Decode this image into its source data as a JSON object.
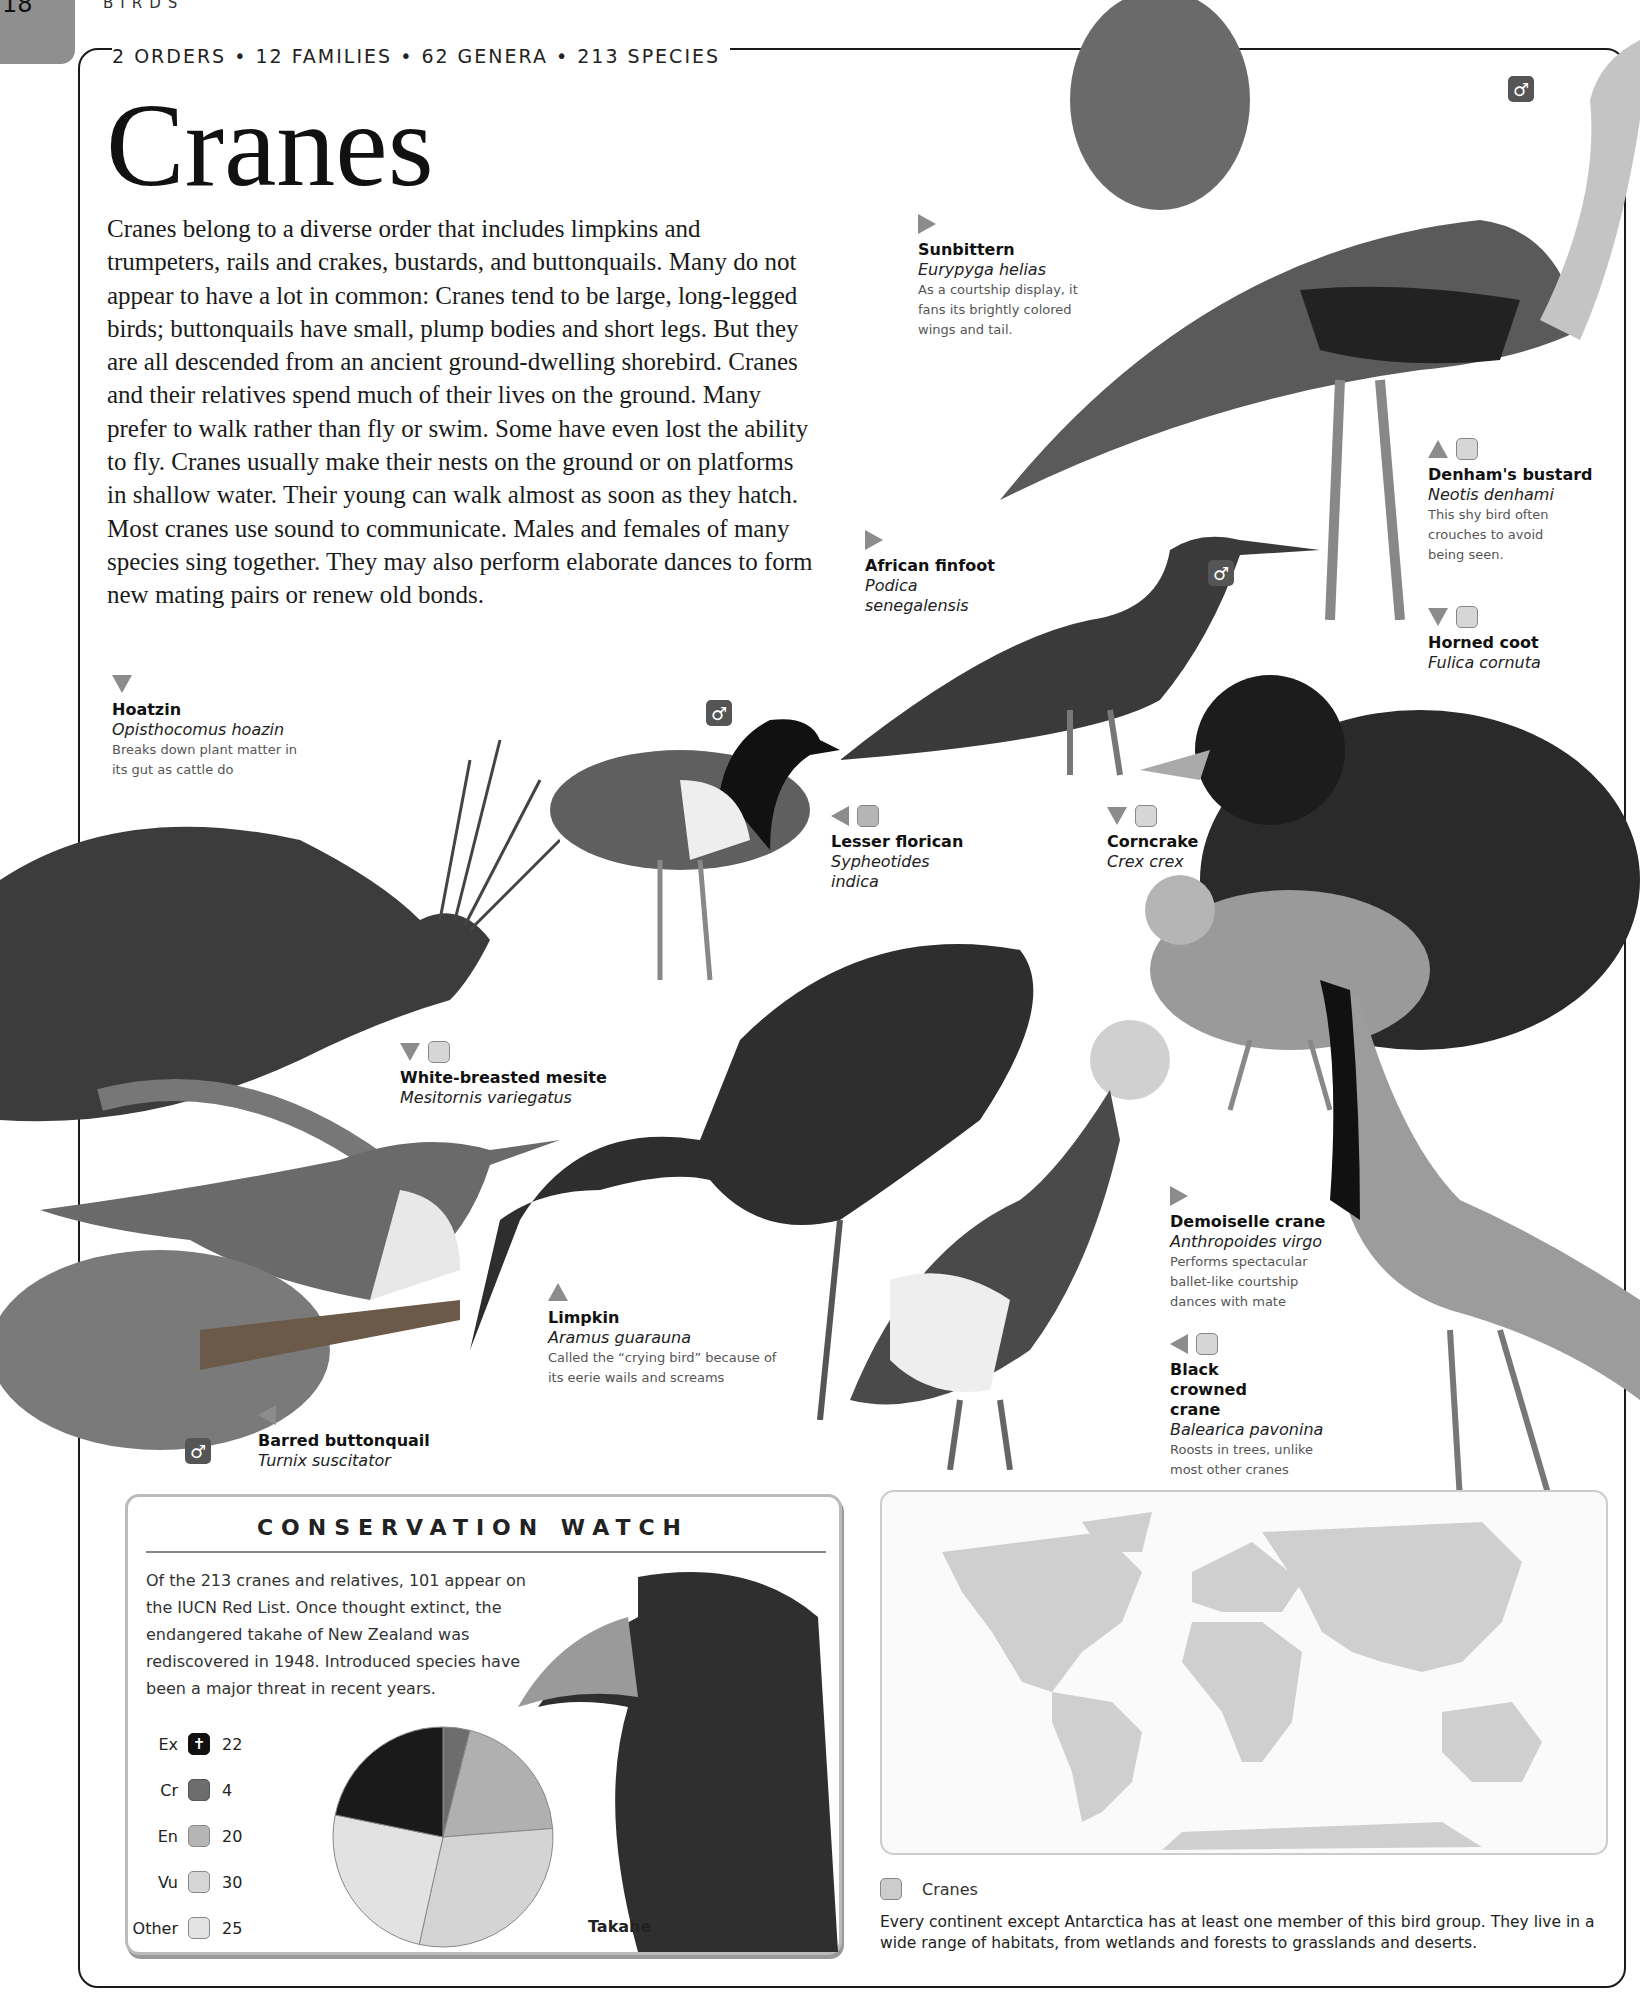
{
  "page": {
    "number": "18",
    "section": "BIRDS",
    "stats": "2 ORDERS • 12 FAMILIES • 62 GENERA • 213 SPECIES",
    "title": "Cranes",
    "intro": "Cranes belong to a diverse order that includes limpkins and trumpeters, rails and crakes, bustards, and buttonquails. Many do not appear to have a lot in common: Cranes tend to be large, long-legged birds; buttonquails have small, plump bodies and short legs. But they are all descended from an ancient ground-dwelling shorebird. Cranes and their relatives spend much of their lives on the ground. Many prefer to walk rather than fly or swim. Some have even lost the ability to fly. Cranes usually make their nests on the ground or on platforms in shallow water. Their young can walk almost as soon as they hatch. Most cranes use sound to communicate. Males and females of many species sing together. They may also perform elaborate dances to form new mating pairs or renew old bonds."
  },
  "species": [
    {
      "name": "Sunbittern",
      "scientific": "Eurypyga helias",
      "note": "As a courtship display, it fans its brightly colored wings and tail.",
      "pointer": "right",
      "status": null
    },
    {
      "name": "Denham's bustard",
      "scientific": "Neotis denhami",
      "note": "This shy bird often crouches to avoid being seen.",
      "pointer": "up",
      "status": "vu"
    },
    {
      "name": "African finfoot",
      "scientific": "Podica senegalensis",
      "note": "",
      "pointer": "right",
      "status": null
    },
    {
      "name": "Horned coot",
      "scientific": "Fulica cornuta",
      "note": "",
      "pointer": "down",
      "status": "vu"
    },
    {
      "name": "Hoatzin",
      "scientific": "Opisthocomus hoazin",
      "note": "Breaks down plant matter in its gut as cattle do",
      "pointer": "down",
      "status": null
    },
    {
      "name": "Lesser florican",
      "scientific": "Sypheotides indica",
      "note": "",
      "pointer": "left",
      "status": "en"
    },
    {
      "name": "Corncrake",
      "scientific": "Crex crex",
      "note": "",
      "pointer": "down",
      "status": "vu"
    },
    {
      "name": "White-breasted mesite",
      "scientific": "Mesitornis variegatus",
      "note": "",
      "pointer": "down",
      "status": "vu"
    },
    {
      "name": "Demoiselle crane",
      "scientific": "Anthropoides virgo",
      "note": "Performs spectacular ballet-like courtship dances with mate",
      "pointer": "right",
      "status": null
    },
    {
      "name": "Limpkin",
      "scientific": "Aramus guarauna",
      "note": "Called the “crying bird” because of its eerie wails and screams",
      "pointer": "up",
      "status": null
    },
    {
      "name": "Black crowned crane",
      "scientific": "Balearica pavonina",
      "note": "Roosts in trees, unlike most other cranes",
      "pointer": "left",
      "status": "vu"
    },
    {
      "name": "Barred buttonquail",
      "scientific": "Turnix suscitator",
      "note": "",
      "pointer": "left",
      "status": null
    }
  ],
  "sex_symbol": "♂",
  "conservation": {
    "title": "CONSERVATION WATCH",
    "text": "Of the 213 cranes and relatives, 101 appear on the IUCN Red List. Once thought extinct, the endangered takahe of New Zealand was rediscovered in 1948. Introduced species have been a major threat in recent years.",
    "image_label": "Takahe",
    "legend": [
      {
        "code": "Ex",
        "count": "22",
        "icon": "cross-icon"
      },
      {
        "code": "Cr",
        "count": "4",
        "icon": "status-icon"
      },
      {
        "code": "En",
        "count": "20",
        "icon": "status-icon"
      },
      {
        "code": "Vu",
        "count": "30",
        "icon": "status-icon"
      },
      {
        "code": "Other",
        "count": "25",
        "icon": "status-icon"
      }
    ]
  },
  "chart_data": {
    "type": "pie",
    "categories": [
      "Ex",
      "Cr",
      "En",
      "Vu",
      "Other"
    ],
    "values": [
      22,
      4,
      20,
      30,
      25
    ],
    "colors": [
      "#1a1a1a",
      "#6d6d6d",
      "#b0b0b0",
      "#d4d4d4",
      "#e2e2e2"
    ]
  },
  "map": {
    "legend_label": "Cranes",
    "caption": "Every continent except Antarctica has at least one member of this bird group. They live in a wide range of habitats, from wetlands and forests to grasslands and deserts."
  }
}
